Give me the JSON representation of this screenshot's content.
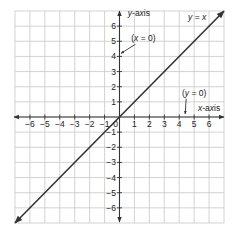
{
  "chart_data": {
    "type": "line",
    "title": "",
    "xlabel": "x-axis",
    "ylabel": "y-axis",
    "xlim": [
      -7,
      7
    ],
    "ylim": [
      -7,
      7
    ],
    "grid": true,
    "x_ticks": [
      -6,
      -5,
      -4,
      -3,
      -2,
      -1,
      0,
      1,
      2,
      3,
      4,
      5,
      6
    ],
    "y_ticks": [
      6,
      5,
      4,
      3,
      2,
      1,
      -1,
      -2,
      -3,
      -4,
      -5,
      -6
    ],
    "x_tick_labels": [
      "−6",
      "−5",
      "−4",
      "−3",
      "−2",
      "−1",
      "0",
      "1",
      "2",
      "3",
      "4",
      "5",
      "6"
    ],
    "y_tick_labels": [
      "6",
      "5",
      "4",
      "3",
      "2",
      "1",
      "−1",
      "−2",
      "−3",
      "−4",
      "−5",
      "−6"
    ],
    "series": [
      {
        "name": "y = x",
        "x": [
          -7,
          -6,
          -5,
          -4,
          -3,
          -2,
          -1,
          0,
          1,
          2,
          3,
          4,
          5,
          6,
          7
        ],
        "y": [
          -7,
          -6,
          -5,
          -4,
          -3,
          -2,
          -1,
          0,
          1,
          2,
          3,
          4,
          5,
          6,
          7
        ],
        "color": "#333333",
        "arrows": "both"
      }
    ],
    "annotations": [
      {
        "text": "y = x",
        "x": 5.2,
        "y": 6.4,
        "italic_vars": true
      },
      {
        "text": "(x = 0)",
        "x": 1.6,
        "y": 5.0,
        "points_to": [
          0.1,
          4.2
        ],
        "describes": "y-axis"
      },
      {
        "text": "(y = 0)",
        "x": 5.0,
        "y": 1.4,
        "points_to": [
          4.4,
          0.2
        ],
        "describes": "x-axis"
      },
      {
        "text": "y-axis",
        "x": 1.3,
        "y": 6.7
      },
      {
        "text": "x-axis",
        "x": 6.0,
        "y": 0.4
      }
    ],
    "legend": null
  },
  "colors": {
    "grid": "#c8c8c8",
    "axis": "#333333",
    "line": "#333333",
    "text": "#222222",
    "background": "#ffffff"
  }
}
